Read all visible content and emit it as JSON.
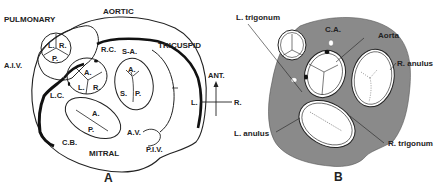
{
  "figure": {
    "panel_a": {
      "caption": "A",
      "valve_labels": {
        "pulmonary": "PULMONARY",
        "aortic": "AORTIC",
        "tricuspid": "TRICUSPID",
        "mitral": "MITRAL"
      },
      "vessel_labels": {
        "aiv": "A.I.V.",
        "rc": "R.C.",
        "sa": "S-A.",
        "lc": "L.C.",
        "cb": "C.B.",
        "av": "A.V.",
        "piv": "P.I.V."
      },
      "cusp_labels": {
        "pulmonary": [
          "L.",
          "R.",
          "P."
        ],
        "aortic": [
          "A.",
          "L.",
          "R."
        ],
        "tricuspid": [
          "A.",
          "S.",
          "P."
        ],
        "mitral": [
          "A.",
          "P."
        ]
      }
    },
    "orientation": {
      "ant": "ANT.",
      "left": "L.",
      "right": "R."
    },
    "panel_b": {
      "caption": "B",
      "labels": {
        "l_trigonum": "L. trigonum",
        "ca": "C.A.",
        "aorta": "Aorta",
        "r_anulus": "R. anulus",
        "l_anulus": "L. anulus",
        "r_trigonum": "R. trigonum"
      },
      "colors": {
        "fibrous_skeleton": "#8a8a8a",
        "outline": "#222222"
      }
    }
  }
}
